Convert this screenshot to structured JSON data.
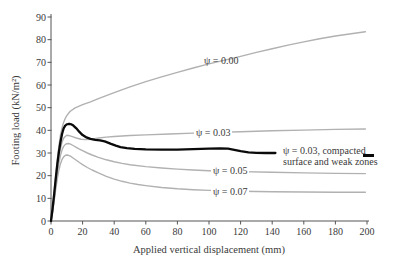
{
  "figure_title": "",
  "axes": {
    "x_title": "Applied vertical displacement (mm)",
    "y_title": "Footing load (kN/m²)"
  },
  "labels": {
    "psi000": "ψ = 0.00",
    "psi003": "ψ = 0.03",
    "psi005": "ψ = 0.05",
    "psi007": "ψ = 0.07",
    "black_line1": "ψ = 0.03, compacted",
    "black_line2": "surface and weak zones"
  },
  "colors": {
    "gray_curve": "#b1b1b1",
    "black_curve": "#0a0a0a",
    "axis": "#555555",
    "text": "#3a3a3a"
  },
  "chart_data": {
    "type": "line",
    "title": "",
    "xlabel": "Applied vertical displacement (mm)",
    "ylabel": "Footing load (kN/m²)",
    "xlim": [
      0,
      200
    ],
    "ylim": [
      0,
      90
    ],
    "x_ticks": [
      0,
      20,
      40,
      60,
      80,
      100,
      120,
      140,
      160,
      180,
      200
    ],
    "y_ticks": [
      0,
      10,
      20,
      30,
      40,
      50,
      60,
      70,
      80,
      90
    ],
    "grid": false,
    "legend_position": "inline-labels",
    "series": [
      {
        "key": "psi-000",
        "name": "ψ = 0.00",
        "color": "#b1b1b1",
        "width": 1.4,
        "points": [
          [
            0,
            0
          ],
          [
            1,
            6
          ],
          [
            2,
            13
          ],
          [
            3,
            20
          ],
          [
            4,
            27
          ],
          [
            5,
            33
          ],
          [
            6,
            38
          ],
          [
            7,
            41.2
          ],
          [
            8,
            43.5
          ],
          [
            9,
            45.2
          ],
          [
            10,
            46.5
          ],
          [
            12,
            48.3
          ],
          [
            15,
            49.8
          ],
          [
            20,
            51.3
          ],
          [
            25,
            52.6
          ],
          [
            30,
            54
          ],
          [
            35,
            55.3
          ],
          [
            40,
            56.6
          ],
          [
            50,
            59.2
          ],
          [
            60,
            61.5
          ],
          [
            70,
            63.6
          ],
          [
            80,
            65.6
          ],
          [
            90,
            67.5
          ],
          [
            100,
            69.3
          ],
          [
            110,
            71
          ],
          [
            120,
            72.6
          ],
          [
            130,
            74.4
          ],
          [
            140,
            76
          ],
          [
            150,
            77.6
          ],
          [
            160,
            79
          ],
          [
            170,
            80.4
          ],
          [
            180,
            81.6
          ],
          [
            190,
            82.6
          ],
          [
            199,
            83.5
          ]
        ]
      },
      {
        "key": "psi-003",
        "name": "ψ = 0.03",
        "color": "#b1b1b1",
        "width": 1.4,
        "points": [
          [
            0,
            0
          ],
          [
            1,
            5
          ],
          [
            2,
            11
          ],
          [
            3,
            17
          ],
          [
            4,
            23
          ],
          [
            5,
            28
          ],
          [
            6,
            32
          ],
          [
            7,
            34.8
          ],
          [
            8,
            36.5
          ],
          [
            9,
            37.3
          ],
          [
            10,
            37.8
          ],
          [
            12,
            37.6
          ],
          [
            14,
            37.1
          ],
          [
            16,
            36.6
          ],
          [
            19,
            36.1
          ],
          [
            22,
            35.9
          ],
          [
            26,
            36.1
          ],
          [
            30,
            36.6
          ],
          [
            35,
            37
          ],
          [
            40,
            37.3
          ],
          [
            50,
            37.7
          ],
          [
            60,
            38
          ],
          [
            75,
            38.4
          ],
          [
            90,
            38.8
          ],
          [
            105,
            39.1
          ],
          [
            120,
            39.4
          ],
          [
            140,
            39.8
          ],
          [
            160,
            40.1
          ],
          [
            180,
            40.4
          ],
          [
            199,
            40.6
          ]
        ]
      },
      {
        "key": "psi-003-compacted",
        "name": "ψ = 0.03, compacted surface and weak zones",
        "color": "#0a0a0a",
        "width": 2.3,
        "points": [
          [
            0,
            0
          ],
          [
            1,
            5.5
          ],
          [
            2,
            12
          ],
          [
            3,
            18.5
          ],
          [
            4,
            25
          ],
          [
            5,
            30.5
          ],
          [
            6,
            35
          ],
          [
            7,
            38.5
          ],
          [
            8,
            40.8
          ],
          [
            9,
            42.1
          ],
          [
            10,
            42.6
          ],
          [
            11,
            42.8
          ],
          [
            12,
            42.8
          ],
          [
            13,
            42.6
          ],
          [
            14,
            42.2
          ],
          [
            16,
            40.9
          ],
          [
            18,
            39.3
          ],
          [
            20,
            37.9
          ],
          [
            22,
            37
          ],
          [
            25,
            36.2
          ],
          [
            28,
            35.8
          ],
          [
            31,
            35.6
          ],
          [
            34,
            35.1
          ],
          [
            36,
            34.6
          ],
          [
            38,
            34
          ],
          [
            41,
            33.2
          ],
          [
            44,
            32.6
          ],
          [
            48,
            32.1
          ],
          [
            53,
            31.8
          ],
          [
            60,
            31.6
          ],
          [
            70,
            31.5
          ],
          [
            80,
            31.5
          ],
          [
            90,
            31.7
          ],
          [
            100,
            31.9
          ],
          [
            107,
            32
          ],
          [
            112,
            31.9
          ],
          [
            116,
            31.4
          ],
          [
            120,
            30.8
          ],
          [
            125,
            30.3
          ],
          [
            130,
            30.1
          ],
          [
            136,
            30
          ],
          [
            142,
            30
          ]
        ]
      },
      {
        "key": "psi-005",
        "name": "ψ = 0.05",
        "color": "#b1b1b1",
        "width": 1.4,
        "points": [
          [
            0,
            0
          ],
          [
            1,
            4.5
          ],
          [
            2,
            10
          ],
          [
            3,
            15.5
          ],
          [
            4,
            21
          ],
          [
            5,
            25.5
          ],
          [
            6,
            29
          ],
          [
            7,
            31.4
          ],
          [
            8,
            32.9
          ],
          [
            9,
            33.7
          ],
          [
            10,
            34.1
          ],
          [
            11,
            34.2
          ],
          [
            12,
            34
          ],
          [
            14,
            33.3
          ],
          [
            16,
            32.5
          ],
          [
            18,
            31.7
          ],
          [
            20,
            31
          ],
          [
            23,
            30
          ],
          [
            26,
            29.1
          ],
          [
            30,
            28.1
          ],
          [
            35,
            27
          ],
          [
            40,
            26.1
          ],
          [
            45,
            25.4
          ],
          [
            50,
            24.8
          ],
          [
            60,
            24
          ],
          [
            70,
            23.4
          ],
          [
            80,
            22.9
          ],
          [
            90,
            22.5
          ],
          [
            100,
            22.2
          ],
          [
            110,
            22
          ],
          [
            120,
            21.8
          ],
          [
            140,
            21.5
          ],
          [
            160,
            21.2
          ],
          [
            180,
            21
          ],
          [
            199,
            20.9
          ]
        ]
      },
      {
        "key": "psi-007",
        "name": "ψ = 0.07",
        "color": "#b1b1b1",
        "width": 1.4,
        "points": [
          [
            0,
            0
          ],
          [
            1,
            4
          ],
          [
            2,
            9
          ],
          [
            3,
            14
          ],
          [
            4,
            18.5
          ],
          [
            5,
            22.5
          ],
          [
            6,
            25.3
          ],
          [
            7,
            27.2
          ],
          [
            8,
            28.3
          ],
          [
            9,
            28.9
          ],
          [
            10,
            29.1
          ],
          [
            11,
            29
          ],
          [
            12,
            28.7
          ],
          [
            14,
            27.8
          ],
          [
            16,
            26.8
          ],
          [
            18,
            25.8
          ],
          [
            20,
            24.9
          ],
          [
            23,
            23.6
          ],
          [
            26,
            22.5
          ],
          [
            30,
            21.2
          ],
          [
            35,
            19.7
          ],
          [
            40,
            18.5
          ],
          [
            45,
            17.5
          ],
          [
            50,
            16.7
          ],
          [
            55,
            16.1
          ],
          [
            60,
            15.6
          ],
          [
            70,
            14.8
          ],
          [
            80,
            14.2
          ],
          [
            90,
            13.8
          ],
          [
            100,
            13.5
          ],
          [
            110,
            13.3
          ],
          [
            120,
            13.1
          ],
          [
            140,
            12.9
          ],
          [
            160,
            12.8
          ],
          [
            180,
            12.7
          ],
          [
            199,
            12.7
          ]
        ]
      }
    ],
    "annotations": [
      {
        "text": "ψ = 0.00",
        "attached_to": "psi-000"
      },
      {
        "text": "ψ = 0.03",
        "attached_to": "psi-003"
      },
      {
        "text": "ψ = 0.03, compacted surface and weak zones",
        "attached_to": "psi-003-compacted",
        "marker": "black-dash"
      },
      {
        "text": "ψ = 0.05",
        "attached_to": "psi-005"
      },
      {
        "text": "ψ = 0.07",
        "attached_to": "psi-007"
      }
    ]
  }
}
